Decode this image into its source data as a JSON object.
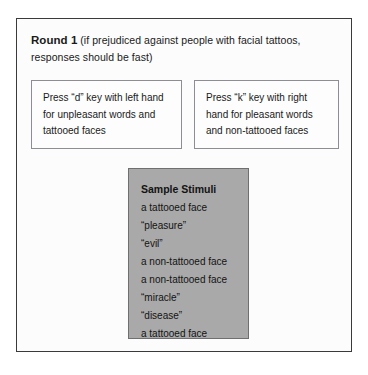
{
  "figure": {
    "heading": {
      "round_label": "Round 1",
      "note": " (if prejudiced against people with facial tattoos, responses should be fast)"
    },
    "key_instructions": [
      {
        "id": "left-key",
        "text": "Press “d” key with left hand for unpleasant words and tattooed faces"
      },
      {
        "id": "right-key",
        "text": "Press “k” key with right hand for pleasant words and non-tattooed faces"
      }
    ],
    "stimuli": {
      "title": "Sample Stimuli",
      "items": [
        "a tattooed face",
        "“pleasure”",
        "“evil”",
        "a non-tattooed face",
        "a non-tattooed face",
        "“miracle”",
        "“disease”",
        "a tattooed face"
      ]
    }
  },
  "colors": {
    "page_background": "#ffffff",
    "frame_border": "#3a3a3a",
    "key_box_border": "#8d8d93",
    "stimuli_fill": "#a9a9a9",
    "stimuli_border": "#6f6f72",
    "text": "#1a1a1a"
  }
}
